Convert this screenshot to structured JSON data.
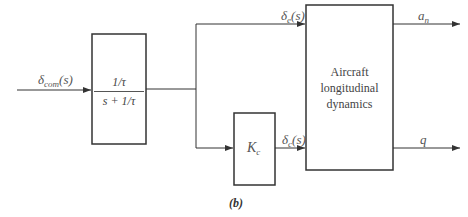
{
  "diagram": {
    "type": "block-diagram",
    "caption": "(b)",
    "input_signal": {
      "symbol": "δ",
      "subscript": "com",
      "arg": "(s)"
    },
    "blocks": [
      {
        "id": "filter",
        "numerator": "1/τ",
        "denominator": "s + 1/τ"
      },
      {
        "id": "gain",
        "symbol": "K",
        "subscript": "c"
      },
      {
        "id": "plant",
        "lines": [
          "Aircraft",
          "longitudinal",
          "dynamics"
        ]
      }
    ],
    "signals": {
      "delta_e": {
        "symbol": "δ",
        "subscript": "e",
        "arg": "(s)"
      },
      "delta_c": {
        "symbol": "δ",
        "subscript": "c",
        "arg": "(s)"
      }
    },
    "outputs": [
      {
        "symbol": "a",
        "subscript": "n"
      },
      {
        "symbol": "q",
        "subscript": ""
      }
    ],
    "colors": {
      "line": "#333333",
      "background": "#ffffff"
    }
  }
}
